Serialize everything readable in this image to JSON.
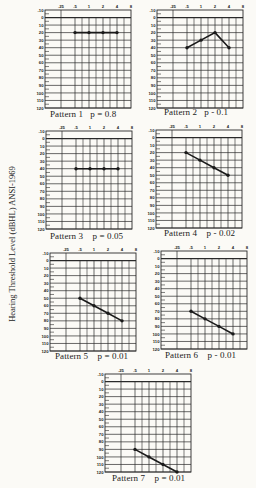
{
  "figure": {
    "y_axis_label": "Hearing Threshold Level (dBHL) ANSI-1969"
  },
  "chart_data": {
    "type": "line",
    "title": "",
    "ylabel": "Hearing Threshold Level (dBHL) ANSI-1969",
    "xlabel": "",
    "x_ticks": [
      ".25",
      ".5",
      "1",
      "2",
      "4",
      "8"
    ],
    "y_ticks": [
      "-10",
      "0",
      "10",
      "20",
      "30",
      "40",
      "50",
      "60",
      "70",
      "80",
      "90",
      "100",
      "110",
      "120"
    ],
    "ylim": [
      -10,
      120
    ],
    "y_inverted": true,
    "grid": true,
    "x": [
      ".5",
      "1",
      "2",
      "4"
    ],
    "panels": [
      {
        "name": "Pattern 1",
        "p": "p = 0.8",
        "values": [
          20,
          20,
          20,
          20
        ]
      },
      {
        "name": "Pattern 2",
        "p": "p - 0.1",
        "values": [
          40,
          30,
          20,
          40
        ]
      },
      {
        "name": "Pattern 3",
        "p": "p = 0.05",
        "values": [
          40,
          40,
          40,
          40
        ]
      },
      {
        "name": "Pattern 4",
        "p": "p - 0.02",
        "values": [
          20,
          30,
          40,
          50
        ]
      },
      {
        "name": "Pattern 5",
        "p": "p = 0.01",
        "values": [
          50,
          60,
          70,
          80
        ]
      },
      {
        "name": "Pattern 6",
        "p": "p - 0.01",
        "values": [
          70,
          80,
          90,
          100
        ]
      },
      {
        "name": "Pattern 7",
        "p": "p = 0.01",
        "values": [
          90,
          100,
          110,
          120
        ]
      }
    ]
  },
  "panel_captions": [
    {
      "label": "Pattern 1",
      "p": "p = 0.8"
    },
    {
      "label": "Pattern 2",
      "p": "p - 0.1"
    },
    {
      "label": "Pattern 3",
      "p": "p = 0.05"
    },
    {
      "label": "Pattern 4",
      "p": "p - 0.02"
    },
    {
      "label": "Pattern 5",
      "p": "p = 0.01"
    },
    {
      "label": "Pattern 6",
      "p": "p - 0.01"
    },
    {
      "label": "Pattern 7",
      "p": "p = 0.01"
    }
  ],
  "colors": {
    "ink": "#1a1a1a",
    "grid": "#2a2a2a",
    "paper": "#fbfaf6"
  }
}
